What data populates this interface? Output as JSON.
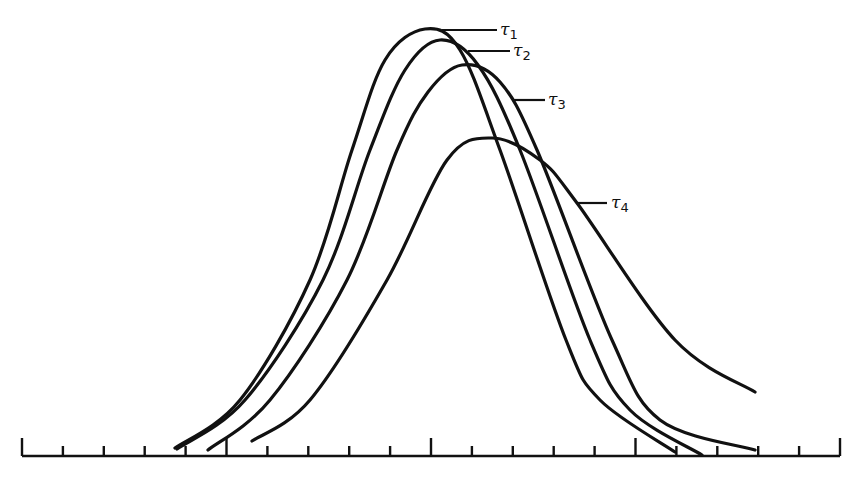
{
  "chart_data": {
    "type": "line",
    "title": "",
    "xlabel": "",
    "ylabel": "",
    "grid": false,
    "legend": "inline leader-line labels at right of each curve peak",
    "x_axis": {
      "ticks": 21,
      "major_every": 5,
      "tick_labels": []
    },
    "series": [
      {
        "name": "τ1",
        "label_base": "τ",
        "label_sub": "1",
        "peak_rel_height": 1.0,
        "peak_x_tick": 10.0,
        "points_px": [
          [
            175,
            448
          ],
          [
            240,
            400
          ],
          [
            310,
            280
          ],
          [
            352,
            150
          ],
          [
            385,
            60
          ],
          [
            425,
            29
          ],
          [
            460,
            50
          ],
          [
            500,
            150
          ],
          [
            566,
            340
          ],
          [
            600,
            400
          ],
          [
            675,
            452
          ]
        ]
      },
      {
        "name": "τ2",
        "label_base": "τ",
        "label_sub": "2",
        "peak_rel_height": 0.97,
        "peak_x_tick": 10.4,
        "points_px": [
          [
            177,
            449
          ],
          [
            245,
            400
          ],
          [
            323,
            280
          ],
          [
            370,
            150
          ],
          [
            405,
            70
          ],
          [
            440,
            40
          ],
          [
            478,
            65
          ],
          [
            520,
            150
          ],
          [
            590,
            340
          ],
          [
            630,
            410
          ],
          [
            702,
            455
          ]
        ]
      },
      {
        "name": "τ3",
        "label_base": "τ",
        "label_sub": "3",
        "peak_rel_height": 0.91,
        "peak_x_tick": 10.9,
        "points_px": [
          [
            208,
            450
          ],
          [
            270,
            400
          ],
          [
            347,
            280
          ],
          [
            397,
            150
          ],
          [
            428,
            92
          ],
          [
            462,
            65
          ],
          [
            500,
            82
          ],
          [
            537,
            150
          ],
          [
            612,
            340
          ],
          [
            660,
            420
          ],
          [
            755,
            450
          ]
        ]
      },
      {
        "name": "τ4",
        "label_base": "τ",
        "label_sub": "4",
        "peak_rel_height": 0.75,
        "peak_x_tick": 11.4,
        "points_px": [
          [
            252,
            441
          ],
          [
            310,
            400
          ],
          [
            387,
            280
          ],
          [
            447,
            160
          ],
          [
            492,
            138
          ],
          [
            540,
            160
          ],
          [
            577,
            203
          ],
          [
            675,
            340
          ],
          [
            755,
            392
          ]
        ]
      }
    ],
    "annotations": [
      {
        "text": "τ1",
        "leader_from": [
          442,
          30
        ],
        "leader_to": [
          497,
          30
        ]
      },
      {
        "text": "τ2",
        "leader_from": [
          468,
          51
        ],
        "leader_to": [
          510,
          51
        ]
      },
      {
        "text": "τ3",
        "leader_from": [
          514,
          100
        ],
        "leader_to": [
          545,
          100
        ]
      },
      {
        "text": "τ4",
        "leader_from": [
          577,
          203
        ],
        "leader_to": [
          607,
          203
        ]
      }
    ]
  },
  "labels": {
    "t1": {
      "base": "τ",
      "sub": "1"
    },
    "t2": {
      "base": "τ",
      "sub": "2"
    },
    "t3": {
      "base": "τ",
      "sub": "3"
    },
    "t4": {
      "base": "τ",
      "sub": "4"
    }
  }
}
